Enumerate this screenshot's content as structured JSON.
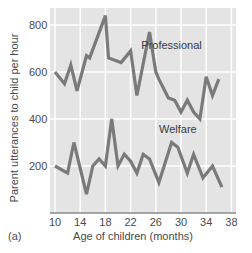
{
  "panel_label": "(a)",
  "colors": {
    "plot_background": "#e4e4e4",
    "grid": "#ffffff",
    "line": "#7a7a7a",
    "axis": "#8a8a8a",
    "text": "#4a4a4a"
  },
  "chart_data": {
    "type": "line",
    "title": "",
    "xlabel": "Age of children (months)",
    "ylabel": "Parent utterances to child per hour",
    "xlim": [
      8,
      38
    ],
    "ylim": [
      0,
      850
    ],
    "xticks": [
      10,
      14,
      18,
      22,
      26,
      30,
      34,
      38
    ],
    "yticks": [
      200,
      400,
      600,
      800
    ],
    "grid": true,
    "legend": "inline labels",
    "series": [
      {
        "name": "Professional",
        "label_position": {
          "x": 28.5,
          "y": 700
        },
        "x": [
          10,
          11.5,
          12.5,
          13.5,
          15,
          15.5,
          18,
          18.5,
          20.5,
          22,
          23,
          25,
          26,
          26.5,
          28,
          29,
          30,
          31,
          32,
          33,
          34,
          35,
          36
        ],
        "values": [
          600,
          550,
          630,
          520,
          670,
          660,
          840,
          660,
          640,
          690,
          500,
          770,
          600,
          570,
          490,
          480,
          430,
          480,
          430,
          400,
          580,
          500,
          570
        ]
      },
      {
        "name": "Welfare",
        "label_position": {
          "x": 29.5,
          "y": 340
        },
        "x": [
          10,
          12,
          13,
          15,
          16,
          17,
          18,
          19,
          20,
          21,
          22,
          23,
          24,
          25,
          26.5,
          28.5,
          29.5,
          31,
          32,
          33.5,
          35,
          36.5
        ],
        "values": [
          200,
          170,
          300,
          80,
          200,
          230,
          200,
          400,
          200,
          250,
          220,
          170,
          250,
          230,
          130,
          300,
          280,
          170,
          250,
          150,
          200,
          110
        ]
      }
    ]
  }
}
